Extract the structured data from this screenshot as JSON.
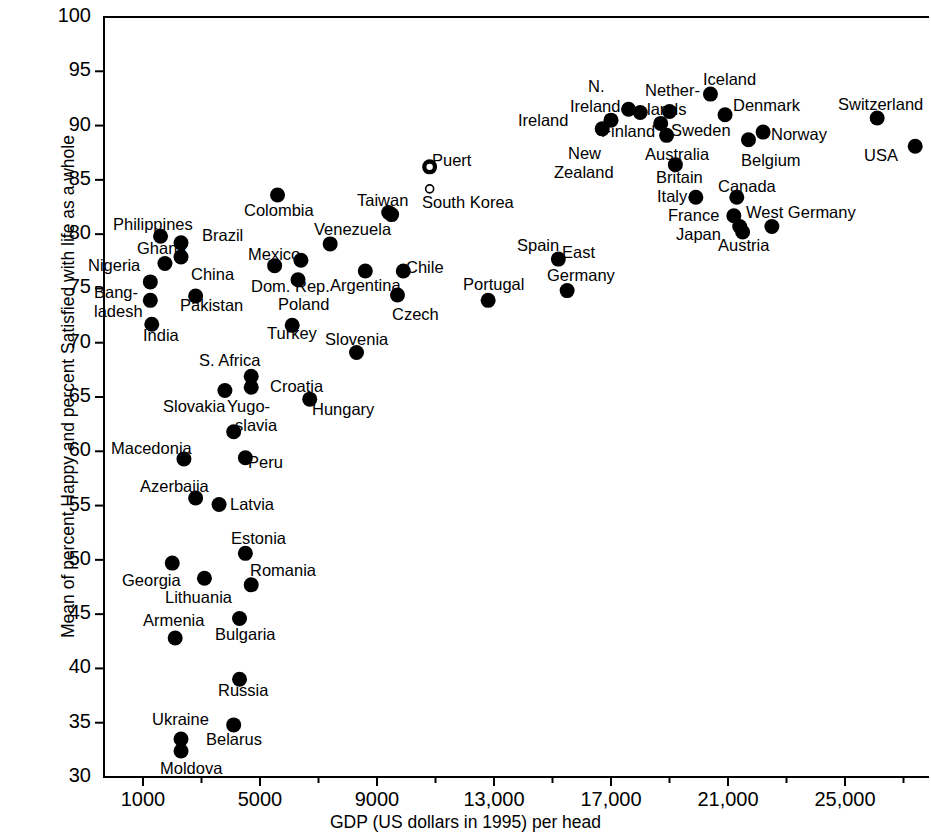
{
  "chart_data": {
    "type": "scatter",
    "title": "",
    "xlabel": "GDP (US dollars in 1995) per head",
    "ylabel": "Mean of percent Happy and percent Satisfied with life as a whole",
    "xlim": [
      0,
      27900
    ],
    "ylim": [
      30,
      100
    ],
    "grid": false,
    "legend": null,
    "x_ticks": [
      1000,
      5000,
      9000,
      13000,
      17000,
      21000,
      25000
    ],
    "x_tick_labels": [
      "1000",
      "5000",
      "9000",
      "13,000",
      "17,000",
      "21,000",
      "25,000"
    ],
    "x_minor_ticks": [
      3000,
      7000,
      11000,
      15000,
      19000,
      23000,
      27000
    ],
    "y_ticks": [
      30,
      35,
      40,
      45,
      50,
      55,
      60,
      65,
      70,
      75,
      80,
      85,
      90,
      95,
      100
    ],
    "y_tick_labels": [
      "30",
      "35",
      "40",
      "45",
      "50",
      "55",
      "60",
      "65",
      "70",
      "75",
      "80",
      "85",
      "90",
      "95",
      "100"
    ],
    "marker": "filled-circle",
    "marker_color": "#000000",
    "points": [
      {
        "name": "Philippines",
        "x": 1600,
        "y": 79.8
      },
      {
        "name": "Ghana",
        "x": 1750,
        "y": 77.3
      },
      {
        "name": "Brazil",
        "x": 2300,
        "y": 79.2
      },
      {
        "name": "China",
        "x": 2300,
        "y": 77.9
      },
      {
        "name": "Nigeria",
        "x": 1250,
        "y": 75.6
      },
      {
        "name": "Bangladesh",
        "x": 1250,
        "y": 73.9
      },
      {
        "name": "India",
        "x": 1300,
        "y": 71.7
      },
      {
        "name": "Pakistan",
        "x": 2800,
        "y": 74.3
      },
      {
        "name": "Colombia",
        "x": 5600,
        "y": 83.6
      },
      {
        "name": "Mexico",
        "x": 5500,
        "y": 77.1
      },
      {
        "name": "Dom. Rep.",
        "x": 6400,
        "y": 77.6
      },
      {
        "name": "Poland",
        "x": 6300,
        "y": 75.8
      },
      {
        "name": "Turkey",
        "x": 6100,
        "y": 71.6
      },
      {
        "name": "Venezuela",
        "x": 7400,
        "y": 79.1
      },
      {
        "name": "Argentina",
        "x": 8600,
        "y": 76.6
      },
      {
        "name": "Taiwan",
        "x": 9400,
        "y": 82.0
      },
      {
        "name": "South Korea",
        "x": 9500,
        "y": 81.8
      },
      {
        "name": "Chile",
        "x": 9900,
        "y": 76.6
      },
      {
        "name": "Czech",
        "x": 9700,
        "y": 74.4
      },
      {
        "name": "Portugal",
        "x": 12800,
        "y": 73.9
      },
      {
        "name": "Spain",
        "x": 15200,
        "y": 77.7
      },
      {
        "name": "East Germany",
        "x": 15500,
        "y": 74.8
      },
      {
        "name": "Puerto Rico",
        "x": 10800,
        "y": 86.2
      },
      {
        "name": "Ireland",
        "x": 17000,
        "y": 90.5
      },
      {
        "name": "N. Ireland",
        "x": 17600,
        "y": 91.5
      },
      {
        "name": "Finland",
        "x": 18000,
        "y": 91.2
      },
      {
        "name": "New Zealand",
        "x": 16700,
        "y": 89.7
      },
      {
        "name": "Netherlands",
        "x": 19000,
        "y": 91.3
      },
      {
        "name": "Sweden",
        "x": 18700,
        "y": 90.2
      },
      {
        "name": "Australia",
        "x": 18900,
        "y": 89.1
      },
      {
        "name": "Iceland",
        "x": 20400,
        "y": 92.9
      },
      {
        "name": "Denmark",
        "x": 20900,
        "y": 91.0
      },
      {
        "name": "Norway",
        "x": 22200,
        "y": 89.4
      },
      {
        "name": "Belgium",
        "x": 21700,
        "y": 88.7
      },
      {
        "name": "Britain",
        "x": 19200,
        "y": 86.4
      },
      {
        "name": "Italy",
        "x": 19900,
        "y": 83.4
      },
      {
        "name": "Canada",
        "x": 21300,
        "y": 83.4
      },
      {
        "name": "France",
        "x": 21200,
        "y": 81.7
      },
      {
        "name": "Japan",
        "x": 21400,
        "y": 80.7
      },
      {
        "name": "Austria",
        "x": 21500,
        "y": 80.2
      },
      {
        "name": "West Germany",
        "x": 22500,
        "y": 80.7
      },
      {
        "name": "Switzerland",
        "x": 26100,
        "y": 90.7
      },
      {
        "name": "USA",
        "x": 27400,
        "y": 88.1
      },
      {
        "name": "S. Africa",
        "x": 4700,
        "y": 66.9
      },
      {
        "name": "Slovakia",
        "x": 3800,
        "y": 65.6
      },
      {
        "name": "Croatia",
        "x": 4700,
        "y": 65.9
      },
      {
        "name": "Hungary",
        "x": 6700,
        "y": 64.8
      },
      {
        "name": "Slovenia",
        "x": 8300,
        "y": 69.1
      },
      {
        "name": "Yugoslavia",
        "x": 4100,
        "y": 61.8
      },
      {
        "name": "Peru",
        "x": 4500,
        "y": 59.4
      },
      {
        "name": "Macedonia",
        "x": 2400,
        "y": 59.3
      },
      {
        "name": "Azerbaijan",
        "x": 2800,
        "y": 55.7
      },
      {
        "name": "Latvia",
        "x": 3600,
        "y": 55.1
      },
      {
        "name": "Estonia",
        "x": 4500,
        "y": 50.6
      },
      {
        "name": "Georgia",
        "x": 2000,
        "y": 49.7
      },
      {
        "name": "Lithuania",
        "x": 3100,
        "y": 48.3
      },
      {
        "name": "Romania",
        "x": 4700,
        "y": 47.7
      },
      {
        "name": "Armenia",
        "x": 2100,
        "y": 42.8
      },
      {
        "name": "Bulgaria",
        "x": 4300,
        "y": 44.6
      },
      {
        "name": "Russia",
        "x": 4300,
        "y": 39.0
      },
      {
        "name": "Ukraine",
        "x": 2300,
        "y": 33.5
      },
      {
        "name": "Belarus",
        "x": 4100,
        "y": 34.8
      },
      {
        "name": "Moldova",
        "x": 2300,
        "y": 32.4
      }
    ],
    "labels": [
      {
        "text": "Philippines",
        "x": 113,
        "y": 216
      },
      {
        "text": "Ghana",
        "x": 137,
        "y": 240
      },
      {
        "text": "Brazil",
        "x": 202,
        "y": 227
      },
      {
        "text": "China",
        "x": 191,
        "y": 266
      },
      {
        "text": "Nigeria",
        "x": 88,
        "y": 257
      },
      {
        "text": "Bang-",
        "x": 94,
        "y": 284
      },
      {
        "text": "ladesh",
        "x": 94,
        "y": 303
      },
      {
        "text": "India",
        "x": 143,
        "y": 327
      },
      {
        "text": "Pakistan",
        "x": 180,
        "y": 297
      },
      {
        "text": "Colombia",
        "x": 244,
        "y": 202
      },
      {
        "text": "Mexico",
        "x": 248,
        "y": 246
      },
      {
        "text": "Dom. Rep.",
        "x": 251,
        "y": 278
      },
      {
        "text": "Poland",
        "x": 278,
        "y": 296
      },
      {
        "text": "Turkey",
        "x": 267,
        "y": 325
      },
      {
        "text": "Venezuela",
        "x": 314,
        "y": 221
      },
      {
        "text": "Argentina",
        "x": 330,
        "y": 277
      },
      {
        "text": "Taiwan",
        "x": 357,
        "y": 192
      },
      {
        "text": "South Korea",
        "x": 422,
        "y": 194
      },
      {
        "text": "Chile",
        "x": 406,
        "y": 259
      },
      {
        "text": "Czech",
        "x": 392,
        "y": 306
      },
      {
        "text": "Portugal",
        "x": 463,
        "y": 276
      },
      {
        "text": "Spain",
        "x": 517,
        "y": 237
      },
      {
        "text": "East",
        "x": 562,
        "y": 244
      },
      {
        "text": "Germany",
        "x": 547,
        "y": 267
      },
      {
        "text": "Puert",
        "x": 432,
        "y": 152
      },
      {
        "text": "Ireland",
        "x": 518,
        "y": 112
      },
      {
        "text": "N.",
        "x": 588,
        "y": 78
      },
      {
        "text": "Ireland",
        "x": 570,
        "y": 98
      },
      {
        "text": "Finland",
        "x": 601,
        "y": 123
      },
      {
        "text": "New",
        "x": 568,
        "y": 145
      },
      {
        "text": "Zealand",
        "x": 554,
        "y": 164
      },
      {
        "text": "Nether-",
        "x": 645,
        "y": 82
      },
      {
        "text": "lands",
        "x": 647,
        "y": 101
      },
      {
        "text": "Sweden",
        "x": 671,
        "y": 122
      },
      {
        "text": "Australia",
        "x": 645,
        "y": 146
      },
      {
        "text": "Iceland",
        "x": 703,
        "y": 71
      },
      {
        "text": "Denmark",
        "x": 733,
        "y": 97
      },
      {
        "text": "Norway",
        "x": 771,
        "y": 126
      },
      {
        "text": "Belgium",
        "x": 741,
        "y": 152
      },
      {
        "text": "Britain",
        "x": 656,
        "y": 169
      },
      {
        "text": "Italy",
        "x": 657,
        "y": 188
      },
      {
        "text": "Canada",
        "x": 718,
        "y": 178
      },
      {
        "text": "France",
        "x": 668,
        "y": 207
      },
      {
        "text": "Japan",
        "x": 676,
        "y": 226
      },
      {
        "text": "Austria",
        "x": 718,
        "y": 237
      },
      {
        "text": "West Germany",
        "x": 746,
        "y": 204
      },
      {
        "text": "Switzerland",
        "x": 838,
        "y": 96
      },
      {
        "text": "USA",
        "x": 864,
        "y": 147
      },
      {
        "text": "S. Africa",
        "x": 199,
        "y": 352
      },
      {
        "text": "Slovakia",
        "x": 163,
        "y": 398
      },
      {
        "text": "Croatia",
        "x": 270,
        "y": 378
      },
      {
        "text": "Hungary",
        "x": 312,
        "y": 401
      },
      {
        "text": "Slovenia",
        "x": 325,
        "y": 331
      },
      {
        "text": "Yugo-",
        "x": 227,
        "y": 398
      },
      {
        "text": "slavia",
        "x": 235,
        "y": 417
      },
      {
        "text": "Peru",
        "x": 248,
        "y": 454
      },
      {
        "text": "Macedonia",
        "x": 111,
        "y": 440
      },
      {
        "text": "Azerbaija",
        "x": 140,
        "y": 478
      },
      {
        "text": "Latvia",
        "x": 230,
        "y": 496
      },
      {
        "text": "Estonia",
        "x": 231,
        "y": 530
      },
      {
        "text": "Georgia",
        "x": 122,
        "y": 572
      },
      {
        "text": "Lithuania",
        "x": 165,
        "y": 589
      },
      {
        "text": "Romania",
        "x": 250,
        "y": 562
      },
      {
        "text": "Armenia",
        "x": 143,
        "y": 612
      },
      {
        "text": "Bulgaria",
        "x": 215,
        "y": 626
      },
      {
        "text": "Russia",
        "x": 218,
        "y": 682
      },
      {
        "text": "Ukraine",
        "x": 152,
        "y": 711
      },
      {
        "text": "Belarus",
        "x": 206,
        "y": 731
      },
      {
        "text": "Moldova",
        "x": 160,
        "y": 760
      }
    ]
  }
}
